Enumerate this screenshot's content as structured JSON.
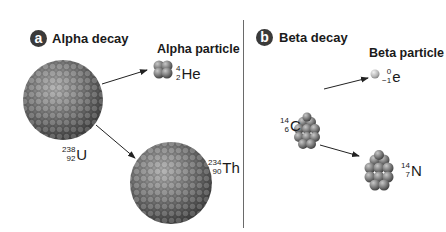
{
  "panels": [
    {
      "badge": "a",
      "title": "Alpha decay",
      "particle_label": "Alpha particle",
      "parent": {
        "mass": "238",
        "atomic": "92",
        "symbol": "U"
      },
      "emitted": {
        "mass": "4",
        "atomic": "2",
        "symbol": "He"
      },
      "daughter": {
        "mass": "234",
        "atomic": "90",
        "symbol": "Th"
      }
    },
    {
      "badge": "b",
      "title": "Beta decay",
      "particle_label": "Beta particle",
      "parent": {
        "mass": "14",
        "atomic": "6",
        "symbol": "C"
      },
      "emitted": {
        "mass": "0",
        "atomic": "−1",
        "symbol": "e"
      },
      "daughter": {
        "mass": "14",
        "atomic": "7",
        "symbol": "N"
      }
    }
  ],
  "colors": {
    "badge": "#3a3a3a",
    "divider": "#6a6a6a",
    "nucleon_dark": "#4a4a4a",
    "nucleon_light": "#9a9a9a",
    "arrow": "#222222"
  }
}
